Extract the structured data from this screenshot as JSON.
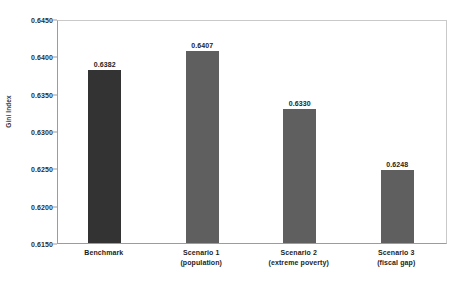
{
  "figure": {
    "clipped_caption_fragment": "",
    "background_color": "#ffffff"
  },
  "chart_data": {
    "type": "bar",
    "title": "",
    "xlabel": "",
    "ylabel": "Gini Index",
    "categories": [
      "Benchmark",
      "Scenario 1 (population)",
      "Scenario 2 (extreme poverty)",
      "Scenario 3 (fiscal gap)"
    ],
    "category_lines": [
      [
        "Benchmark"
      ],
      [
        "Scenario 1",
        "(population)"
      ],
      [
        "Scenario 2",
        "(extreme poverty)"
      ],
      [
        "Scenario 3",
        "(fiscal gap)"
      ]
    ],
    "values": [
      0.6382,
      0.6407,
      0.633,
      0.6248
    ],
    "value_labels": [
      "0.6382",
      "0.6407",
      "0.6330",
      "0.6248"
    ],
    "bar_colors": [
      "#333333",
      "#5f5f5f",
      "#5f5f5f",
      "#5f5f5f"
    ],
    "ylim": [
      0.615,
      0.645
    ],
    "ytick_values": [
      0.645,
      0.64,
      0.635,
      0.63,
      0.625,
      0.62,
      0.615
    ],
    "ytick_labels": [
      "0.6450",
      "0.6400",
      "0.6350",
      "0.6300",
      "0.6250",
      "0.6200",
      "0.6150"
    ],
    "grid": false,
    "legend": null,
    "axis_color": "#9c9c9c"
  }
}
